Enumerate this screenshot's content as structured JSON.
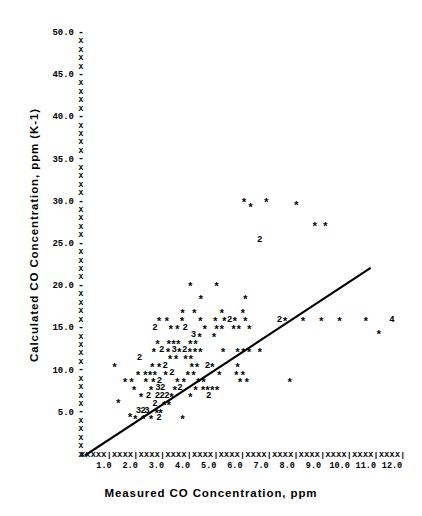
{
  "chart_data": {
    "type": "scatter",
    "title": "",
    "xlabel": "Measured CO Concentration, ppm",
    "ylabel": "Calculated CO Concentration, ppm (K-1)",
    "xlim": [
      0,
      12.5
    ],
    "ylim": [
      0,
      51.5
    ],
    "grid": false,
    "legend": null,
    "marker_note": "Asterisk = 1 observation; digit = number of coincident observations",
    "axis_style": "line-printer ASCII: axes drawn with X characters and | tick marks",
    "xticks": [
      "1.0",
      "2.0",
      "3.0",
      "4.0",
      "5.0",
      "6.0",
      "7.0",
      "8.0",
      "9.0",
      "10.0",
      "11.0",
      "12.0"
    ],
    "xtick_values": [
      1,
      2,
      3,
      4,
      5,
      6,
      7,
      8,
      9,
      10,
      11,
      12
    ],
    "yticks": [
      "5.0",
      "10.0",
      "15.0",
      "20.0",
      "25.0",
      "30.0",
      "35.0",
      "40.0",
      "45.0",
      "50.0"
    ],
    "ytick_values": [
      5,
      10,
      15,
      20,
      25,
      30,
      35,
      40,
      45,
      50
    ],
    "fit_line": {
      "x0": 0.3,
      "y0": 0.0,
      "x1": 11.15,
      "y1": 22.1,
      "slope": 2.04,
      "intercept": -0.61
    },
    "points": [
      {
        "x": 1.55,
        "y": 6.3,
        "m": "*"
      },
      {
        "x": 2.0,
        "y": 4.7,
        "m": "*"
      },
      {
        "x": 2.2,
        "y": 4.4,
        "m": "*"
      },
      {
        "x": 2.32,
        "y": 5.2,
        "m": "3"
      },
      {
        "x": 2.5,
        "y": 5.2,
        "m": "2"
      },
      {
        "x": 2.64,
        "y": 5.2,
        "m": "3"
      },
      {
        "x": 2.5,
        "y": 4.4,
        "m": "*"
      },
      {
        "x": 2.8,
        "y": 4.4,
        "m": "*"
      },
      {
        "x": 3.02,
        "y": 5.2,
        "m": "*"
      },
      {
        "x": 3.16,
        "y": 5.2,
        "m": "*"
      },
      {
        "x": 3.1,
        "y": 4.4,
        "m": "2"
      },
      {
        "x": 4.0,
        "y": 4.4,
        "m": "*"
      },
      {
        "x": 2.95,
        "y": 6.1,
        "m": "2"
      },
      {
        "x": 3.3,
        "y": 6.1,
        "m": "*"
      },
      {
        "x": 3.48,
        "y": 6.1,
        "m": "*"
      },
      {
        "x": 2.42,
        "y": 7.0,
        "m": "*"
      },
      {
        "x": 2.7,
        "y": 7.0,
        "m": "2"
      },
      {
        "x": 3.04,
        "y": 7.0,
        "m": "2"
      },
      {
        "x": 3.22,
        "y": 7.0,
        "m": "2"
      },
      {
        "x": 3.4,
        "y": 7.0,
        "m": "2"
      },
      {
        "x": 3.58,
        "y": 7.0,
        "m": "*"
      },
      {
        "x": 4.3,
        "y": 7.0,
        "m": "*"
      },
      {
        "x": 5.0,
        "y": 7.0,
        "m": "2"
      },
      {
        "x": 2.15,
        "y": 7.9,
        "m": "*"
      },
      {
        "x": 2.8,
        "y": 7.9,
        "m": "*"
      },
      {
        "x": 3.06,
        "y": 7.9,
        "m": "3"
      },
      {
        "x": 3.24,
        "y": 7.9,
        "m": "2"
      },
      {
        "x": 3.7,
        "y": 7.9,
        "m": "*"
      },
      {
        "x": 3.9,
        "y": 7.9,
        "m": "2"
      },
      {
        "x": 4.5,
        "y": 7.9,
        "m": "*"
      },
      {
        "x": 4.78,
        "y": 7.9,
        "m": "*"
      },
      {
        "x": 4.96,
        "y": 7.9,
        "m": "*"
      },
      {
        "x": 5.14,
        "y": 7.9,
        "m": "*"
      },
      {
        "x": 5.32,
        "y": 7.9,
        "m": "*"
      },
      {
        "x": 1.8,
        "y": 8.8,
        "m": "*"
      },
      {
        "x": 2.05,
        "y": 8.8,
        "m": "*"
      },
      {
        "x": 2.6,
        "y": 8.8,
        "m": "*"
      },
      {
        "x": 2.88,
        "y": 8.8,
        "m": "*"
      },
      {
        "x": 3.12,
        "y": 8.8,
        "m": "2"
      },
      {
        "x": 3.8,
        "y": 8.8,
        "m": "*"
      },
      {
        "x": 4.05,
        "y": 8.8,
        "m": "*"
      },
      {
        "x": 4.6,
        "y": 8.8,
        "m": "*"
      },
      {
        "x": 4.8,
        "y": 8.8,
        "m": "*"
      },
      {
        "x": 6.2,
        "y": 8.8,
        "m": "*"
      },
      {
        "x": 6.45,
        "y": 8.8,
        "m": "*"
      },
      {
        "x": 8.1,
        "y": 8.8,
        "m": "*"
      },
      {
        "x": 2.3,
        "y": 9.7,
        "m": "*"
      },
      {
        "x": 2.58,
        "y": 9.7,
        "m": "*"
      },
      {
        "x": 2.76,
        "y": 9.7,
        "m": "*"
      },
      {
        "x": 2.94,
        "y": 9.7,
        "m": "*"
      },
      {
        "x": 3.35,
        "y": 9.7,
        "m": "*"
      },
      {
        "x": 3.6,
        "y": 9.7,
        "m": "2"
      },
      {
        "x": 4.2,
        "y": 9.7,
        "m": "*"
      },
      {
        "x": 4.42,
        "y": 9.7,
        "m": "*"
      },
      {
        "x": 5.4,
        "y": 9.7,
        "m": "*"
      },
      {
        "x": 6.05,
        "y": 9.7,
        "m": "*"
      },
      {
        "x": 6.3,
        "y": 9.7,
        "m": "*"
      },
      {
        "x": 1.4,
        "y": 10.6,
        "m": "*"
      },
      {
        "x": 2.85,
        "y": 10.6,
        "m": "*"
      },
      {
        "x": 3.1,
        "y": 10.6,
        "m": "*"
      },
      {
        "x": 3.34,
        "y": 10.6,
        "m": "2"
      },
      {
        "x": 4.35,
        "y": 10.6,
        "m": "*"
      },
      {
        "x": 4.55,
        "y": 10.6,
        "m": "*"
      },
      {
        "x": 4.95,
        "y": 10.6,
        "m": "2"
      },
      {
        "x": 5.14,
        "y": 10.6,
        "m": "*"
      },
      {
        "x": 6.1,
        "y": 10.6,
        "m": "*"
      },
      {
        "x": 2.35,
        "y": 11.5,
        "m": "2"
      },
      {
        "x": 3.52,
        "y": 11.5,
        "m": "*"
      },
      {
        "x": 3.75,
        "y": 11.5,
        "m": "*"
      },
      {
        "x": 4.12,
        "y": 11.5,
        "m": "*"
      },
      {
        "x": 4.32,
        "y": 11.5,
        "m": "*"
      },
      {
        "x": 2.9,
        "y": 12.4,
        "m": "*"
      },
      {
        "x": 3.2,
        "y": 12.4,
        "m": "2"
      },
      {
        "x": 3.45,
        "y": 12.4,
        "m": "*"
      },
      {
        "x": 3.68,
        "y": 12.4,
        "m": "3"
      },
      {
        "x": 3.88,
        "y": 12.4,
        "m": "*"
      },
      {
        "x": 4.08,
        "y": 12.4,
        "m": "2"
      },
      {
        "x": 4.28,
        "y": 12.4,
        "m": "*"
      },
      {
        "x": 4.48,
        "y": 12.4,
        "m": "*"
      },
      {
        "x": 4.68,
        "y": 12.4,
        "m": "*"
      },
      {
        "x": 5.55,
        "y": 12.4,
        "m": "*"
      },
      {
        "x": 6.1,
        "y": 12.4,
        "m": "*"
      },
      {
        "x": 6.32,
        "y": 12.4,
        "m": "*"
      },
      {
        "x": 6.54,
        "y": 12.4,
        "m": "*"
      },
      {
        "x": 6.95,
        "y": 12.4,
        "m": "*"
      },
      {
        "x": 3.05,
        "y": 13.3,
        "m": "*"
      },
      {
        "x": 3.48,
        "y": 13.3,
        "m": "*"
      },
      {
        "x": 3.66,
        "y": 13.3,
        "m": "*"
      },
      {
        "x": 3.84,
        "y": 13.3,
        "m": "*"
      },
      {
        "x": 4.3,
        "y": 13.3,
        "m": "*"
      },
      {
        "x": 4.5,
        "y": 13.3,
        "m": "*"
      },
      {
        "x": 4.42,
        "y": 14.2,
        "m": "3"
      },
      {
        "x": 4.65,
        "y": 14.2,
        "m": "*"
      },
      {
        "x": 5.2,
        "y": 14.2,
        "m": "*"
      },
      {
        "x": 2.95,
        "y": 15.1,
        "m": "2"
      },
      {
        "x": 3.55,
        "y": 15.1,
        "m": "*"
      },
      {
        "x": 3.8,
        "y": 15.1,
        "m": "*"
      },
      {
        "x": 4.1,
        "y": 15.1,
        "m": "2"
      },
      {
        "x": 4.85,
        "y": 15.1,
        "m": "*"
      },
      {
        "x": 5.3,
        "y": 15.1,
        "m": "*"
      },
      {
        "x": 5.5,
        "y": 15.1,
        "m": "*"
      },
      {
        "x": 5.95,
        "y": 15.1,
        "m": "*"
      },
      {
        "x": 6.15,
        "y": 15.1,
        "m": "*"
      },
      {
        "x": 6.55,
        "y": 15.1,
        "m": "*"
      },
      {
        "x": 3.1,
        "y": 16.0,
        "m": "*"
      },
      {
        "x": 3.4,
        "y": 16.0,
        "m": "*"
      },
      {
        "x": 3.98,
        "y": 16.0,
        "m": "*"
      },
      {
        "x": 4.68,
        "y": 16.0,
        "m": "*"
      },
      {
        "x": 5.25,
        "y": 16.0,
        "m": "*"
      },
      {
        "x": 5.6,
        "y": 16.0,
        "m": "*"
      },
      {
        "x": 5.8,
        "y": 16.0,
        "m": "2"
      },
      {
        "x": 6.0,
        "y": 16.0,
        "m": "*"
      },
      {
        "x": 6.4,
        "y": 16.0,
        "m": "*"
      },
      {
        "x": 7.7,
        "y": 16.0,
        "m": "2"
      },
      {
        "x": 7.92,
        "y": 16.0,
        "m": "*"
      },
      {
        "x": 8.6,
        "y": 16.0,
        "m": "*"
      },
      {
        "x": 9.3,
        "y": 16.0,
        "m": "*"
      },
      {
        "x": 10.0,
        "y": 16.0,
        "m": "*"
      },
      {
        "x": 11.0,
        "y": 16.0,
        "m": "*"
      },
      {
        "x": 12.0,
        "y": 16.0,
        "m": "4"
      },
      {
        "x": 4.0,
        "y": 17.0,
        "m": "*"
      },
      {
        "x": 4.45,
        "y": 17.0,
        "m": "*"
      },
      {
        "x": 5.5,
        "y": 17.0,
        "m": "*"
      },
      {
        "x": 6.3,
        "y": 17.0,
        "m": "*"
      },
      {
        "x": 11.5,
        "y": 14.5,
        "m": "*"
      },
      {
        "x": 4.7,
        "y": 18.6,
        "m": "*"
      },
      {
        "x": 6.4,
        "y": 18.6,
        "m": "*"
      },
      {
        "x": 4.3,
        "y": 20.2,
        "m": "*"
      },
      {
        "x": 5.3,
        "y": 20.2,
        "m": "*"
      },
      {
        "x": 6.95,
        "y": 25.5,
        "m": "2"
      },
      {
        "x": 6.35,
        "y": 30.2,
        "m": "*"
      },
      {
        "x": 6.6,
        "y": 29.6,
        "m": "*"
      },
      {
        "x": 7.2,
        "y": 30.2,
        "m": "*"
      },
      {
        "x": 8.35,
        "y": 29.8,
        "m": "*"
      },
      {
        "x": 9.05,
        "y": 27.3,
        "m": "*"
      },
      {
        "x": 9.45,
        "y": 27.3,
        "m": "*"
      }
    ]
  },
  "axes": {
    "y_glyph": "X",
    "y_tick_glyph": "-",
    "x_glyph": "X",
    "x_tick_glyph": "|",
    "x_axis_string": "XXXXX|XXXX|XXXX|XXXX|XXXX|XXXX|XXXX|XXXX|XXXX|XXXX|XXXX|XXXX|"
  }
}
